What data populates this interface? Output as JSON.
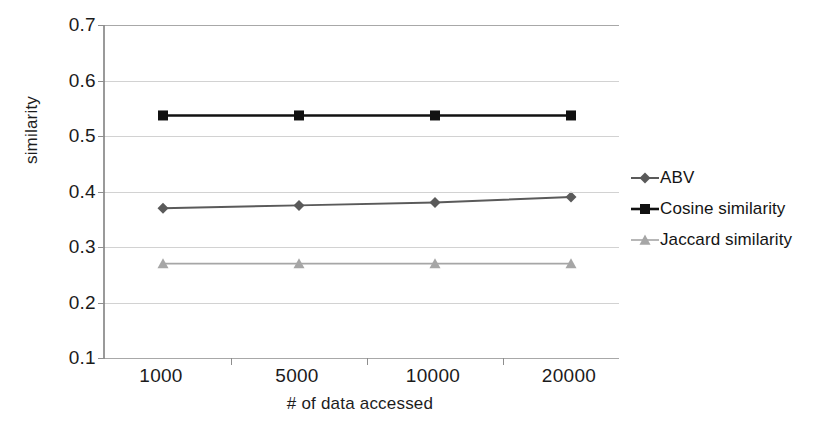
{
  "chart_data": {
    "type": "line",
    "title": "",
    "xlabel": "# of data accessed",
    "ylabel": "similarity",
    "categories": [
      "1000",
      "5000",
      "10000",
      "20000"
    ],
    "x_ticklabels": [
      "1000",
      "5000",
      "10000",
      "20000"
    ],
    "y_ticklabels": [
      "0.1",
      "0.2",
      "0.3",
      "0.4",
      "0.5",
      "0.6",
      "0.7"
    ],
    "yticks": [
      0.1,
      0.2,
      0.3,
      0.4,
      0.5,
      0.6,
      0.7
    ],
    "ylim": [
      0.1,
      0.7
    ],
    "grid": "horizontal",
    "legend_position": "right",
    "series": [
      {
        "name": "ABV",
        "marker": "diamond",
        "color": "#5a5a5a",
        "values": [
          0.37,
          0.375,
          0.38,
          0.39
        ]
      },
      {
        "name": "Cosine similarity",
        "marker": "square",
        "color": "#111111",
        "values": [
          0.537,
          0.537,
          0.537,
          0.537
        ]
      },
      {
        "name": "Jaccard similarity",
        "marker": "triangle",
        "color": "#a6a6a6",
        "values": [
          0.27,
          0.27,
          0.27,
          0.27
        ]
      }
    ]
  },
  "legend": {
    "items": [
      {
        "label": "ABV"
      },
      {
        "label": "Cosine similarity"
      },
      {
        "label": "Jaccard similarity"
      }
    ]
  },
  "axes": {
    "y_title": "similarity",
    "x_title": "# of data accessed"
  }
}
